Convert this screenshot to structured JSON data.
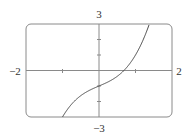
{
  "chart_data": {
    "type": "line",
    "title": "",
    "xlabel": "",
    "ylabel": "",
    "xlim": [
      -2,
      2
    ],
    "ylim": [
      -3,
      3
    ],
    "grid": false,
    "legend": null,
    "function": "x^3 + x - 1",
    "x_tick_labels": [
      "−2",
      "2"
    ],
    "y_tick_labels": [
      "3",
      "−3"
    ],
    "x_ticks": [
      -1,
      1
    ],
    "y_ticks": [
      -2,
      -1,
      1,
      2
    ],
    "series": [
      {
        "name": "f(x)",
        "x": [
          -1.0,
          -0.8,
          -0.6,
          -0.4,
          -0.2,
          0.0,
          0.2,
          0.4,
          0.6,
          0.682,
          0.8,
          1.0,
          1.2,
          1.39
        ],
        "y": [
          -3.0,
          -2.312,
          -1.816,
          -1.464,
          -1.208,
          -1.0,
          -0.792,
          -0.536,
          -0.184,
          0.0,
          0.312,
          1.0,
          1.928,
          3.076
        ]
      }
    ],
    "colors": {
      "curve": "#444444",
      "frame": "#8a8a8a",
      "axes": "#8a8a8a"
    }
  }
}
